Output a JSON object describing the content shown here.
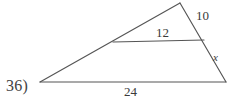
{
  "figure": {
    "problem_number": "36)",
    "stroke_color": "#555555",
    "text_color": "#3a3a3a",
    "background_color": "#ffffff",
    "labels": {
      "upper_right_side": "10",
      "midsegment": "12",
      "lower_right_side": "x",
      "base": "24"
    },
    "geometry": {
      "left_apex": "40,82",
      "top_vertex": "180,3",
      "bottom_right_vertex": "226,82",
      "midsegment_left": "113,42",
      "midsegment_right": "204,40"
    }
  }
}
